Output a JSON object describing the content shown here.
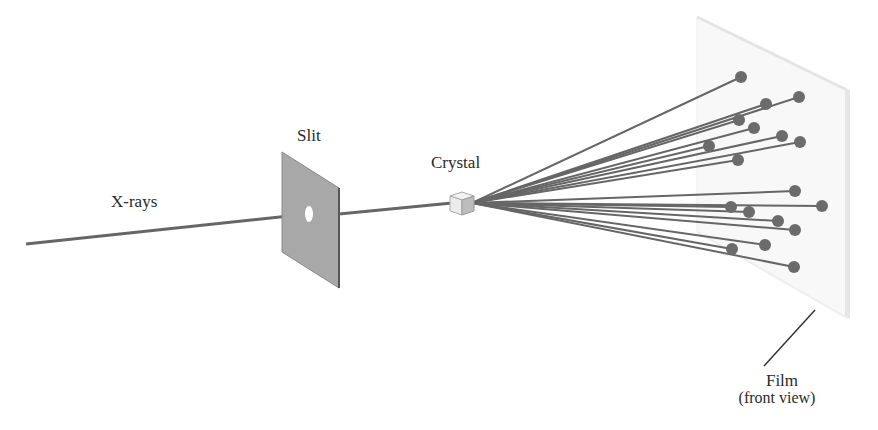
{
  "diagram": {
    "labels": {
      "xrays": "X-rays",
      "slit": "Slit",
      "crystal": "Crystal",
      "film": "Film",
      "film_note": "(front view)"
    },
    "colors": {
      "beam": "#666666",
      "spot": "#6b6b6b",
      "slit_plate": "#a9a9a9",
      "film": "#f7f7f7",
      "text": "#2a2a2a"
    },
    "beam_origin": [
      472,
      203
    ],
    "diffraction_spots": [
      [
        741,
        77
      ],
      [
        766,
        104
      ],
      [
        799,
        97
      ],
      [
        739,
        120
      ],
      [
        754,
        128
      ],
      [
        782,
        136
      ],
      [
        800,
        142
      ],
      [
        709,
        146
      ],
      [
        738,
        160
      ],
      [
        795,
        191
      ],
      [
        731,
        207
      ],
      [
        822,
        206
      ],
      [
        749,
        212
      ],
      [
        778,
        221
      ],
      [
        795,
        230
      ],
      [
        765,
        245
      ],
      [
        732,
        249
      ],
      [
        794,
        267
      ]
    ]
  }
}
